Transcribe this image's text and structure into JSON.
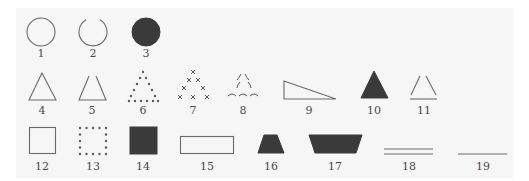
{
  "figure": {
    "colors": {
      "background": "#ffffff",
      "panel": "#f6f6f6",
      "outline": "#6a6a6a",
      "filled": "#3a3a3a",
      "label": "#4a4a4a"
    },
    "shapes": [
      {
        "id": 1,
        "label": "1",
        "kind": "circle-outline"
      },
      {
        "id": 2,
        "label": "2",
        "kind": "circle-open-top"
      },
      {
        "id": 3,
        "label": "3",
        "kind": "circle-filled"
      },
      {
        "id": 4,
        "label": "4",
        "kind": "triangle-outline"
      },
      {
        "id": 5,
        "label": "5",
        "kind": "triangle-open-apex"
      },
      {
        "id": 6,
        "label": "6",
        "kind": "triangle-dotted"
      },
      {
        "id": 7,
        "label": "7",
        "kind": "triangle-x-marks"
      },
      {
        "id": 8,
        "label": "8",
        "kind": "triangle-arc-marks"
      },
      {
        "id": 9,
        "label": "9",
        "kind": "right-triangle-outline"
      },
      {
        "id": 10,
        "label": "10",
        "kind": "triangle-filled"
      },
      {
        "id": 11,
        "label": "11",
        "kind": "triangle-detached-sides"
      },
      {
        "id": 12,
        "label": "12",
        "kind": "square-outline"
      },
      {
        "id": 13,
        "label": "13",
        "kind": "square-dotted"
      },
      {
        "id": 14,
        "label": "14",
        "kind": "square-filled"
      },
      {
        "id": 15,
        "label": "15",
        "kind": "rectangle-outline"
      },
      {
        "id": 16,
        "label": "16",
        "kind": "trapezoid-filled"
      },
      {
        "id": 17,
        "label": "17",
        "kind": "inverted-trapezoid-filled"
      },
      {
        "id": 18,
        "label": "18",
        "kind": "double-parallel-lines"
      },
      {
        "id": 19,
        "label": "19",
        "kind": "single-line"
      }
    ]
  }
}
